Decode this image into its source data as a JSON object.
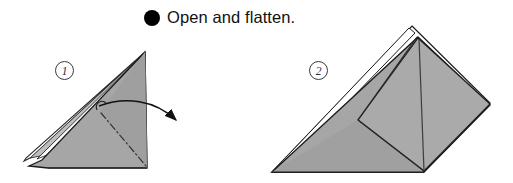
{
  "page": {
    "background_color": "#ffffff",
    "width": 513,
    "height": 183
  },
  "caption": {
    "bullet_icon": "filled-circle-bullet",
    "text": "Open and flatten."
  },
  "steps": [
    {
      "number": "1",
      "badge_label": "1",
      "description": "Folded paper seen from the side with layered edges; a curved arrow indicates opening the pocket and flattening it.",
      "annotations": {
        "action_arrow": "curved-arrow-pointing-right",
        "fold_line_style": "dash-dot mountain fold"
      }
    },
    {
      "number": "2",
      "badge_label": "2",
      "description": "Result after opening and flattening: a broad triangular shape with an inner diamond flap and visible layer outlines.",
      "annotations": {
        "fold_line_style": "solid crease lines"
      }
    }
  ],
  "colors": {
    "paper_fill": "#a6a6a6",
    "paper_fill_shadow": "#9a9a9a",
    "paper_fill_light": "#b4b4b4",
    "outline": "#1a1a1a",
    "white_layer": "#ffffff",
    "bullet": "#000000",
    "badge_stroke": "#3a3a3a"
  }
}
